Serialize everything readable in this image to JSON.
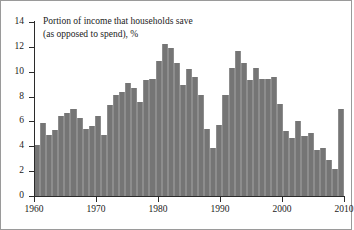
{
  "chart_data": {
    "type": "bar",
    "title": "Portion of income that households save (as opposed to spend), %",
    "title_line1": "Portion of income that households save",
    "title_line2": "(as opposed to spend), %",
    "xlabel": "",
    "ylabel": "",
    "ylim": [
      0,
      14
    ],
    "xlim": [
      1960,
      2010
    ],
    "grid": false,
    "legend": null,
    "bar_color": "#757575",
    "axis_color": "#2b2b2b",
    "background_color": "#ffffff",
    "ytick_labels": [
      "0",
      "2",
      "4",
      "6",
      "8",
      "10",
      "12",
      "14"
    ],
    "ytick_values": [
      0,
      2,
      4,
      6,
      8,
      10,
      12,
      14
    ],
    "xtick_labels": [
      "1960",
      "1970",
      "1980",
      "1990",
      "2000",
      "2010"
    ],
    "xtick_values": [
      1960,
      1970,
      1980,
      1990,
      2000,
      2010
    ],
    "categories": [
      1960,
      1961,
      1962,
      1963,
      1964,
      1965,
      1966,
      1967,
      1968,
      1969,
      1970,
      1971,
      1972,
      1973,
      1974,
      1975,
      1976,
      1977,
      1978,
      1979,
      1980,
      1981,
      1982,
      1983,
      1984,
      1985,
      1986,
      1987,
      1988,
      1989,
      1990,
      1991,
      1992,
      1993,
      1994,
      1995,
      1996,
      1997,
      1998,
      1999,
      2000,
      2001,
      2002,
      2003,
      2004,
      2005,
      2006,
      2007,
      2008,
      2009
    ],
    "values": [
      4.1,
      5.9,
      4.9,
      5.3,
      6.4,
      6.7,
      7.0,
      6.3,
      5.4,
      5.6,
      6.4,
      4.9,
      7.3,
      8.1,
      8.4,
      9.1,
      8.7,
      7.6,
      9.3,
      9.4,
      10.9,
      12.2,
      11.9,
      10.7,
      8.9,
      10.2,
      9.6,
      8.1,
      5.4,
      3.9,
      5.7,
      8.1,
      10.3,
      11.7,
      10.7,
      9.3,
      10.3,
      9.4,
      9.4,
      9.6,
      7.4,
      5.2,
      4.7,
      6.0,
      4.8,
      5.1,
      3.7,
      3.9,
      2.9,
      2.2
    ],
    "last_bar_value": 7.0,
    "last_bar_note": "2009 projection bar"
  },
  "axes": {
    "y_title": "",
    "x_title": ""
  }
}
